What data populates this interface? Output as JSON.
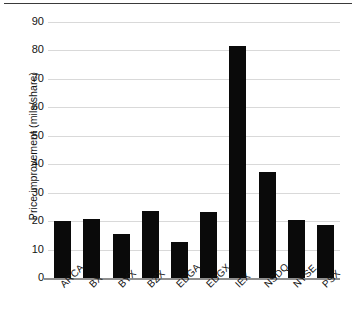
{
  "figure": {
    "top_rule": "",
    "background_color": "#ffffff",
    "bar_color": "#0a0a0a",
    "gridline_color": "#d9d9d9",
    "axis_color": "#8f8f8f"
  },
  "chart_data": {
    "type": "bar",
    "title": "",
    "xlabel": "",
    "ylabel": "Price improvement (mils/share)",
    "categories": [
      "ARCA",
      "BX",
      "BYX",
      "BZX",
      "EDGA",
      "EDGX",
      "IEX",
      "NSDQ",
      "NYSE",
      "PSX"
    ],
    "values": [
      20.0,
      20.8,
      15.5,
      23.5,
      12.7,
      23.2,
      81.5,
      37.2,
      20.5,
      18.5
    ],
    "ylim": [
      0,
      90
    ],
    "yticks": [
      0,
      10,
      20,
      30,
      40,
      50,
      60,
      70,
      80,
      90
    ],
    "ytick_labels": [
      "0",
      "10",
      "20",
      "30",
      "40",
      "50",
      "60",
      "70",
      "80",
      "90"
    ],
    "grid": true,
    "grid_axis": "y",
    "legend": false,
    "legend_position": "none",
    "series": [
      {
        "name": "Price improvement",
        "values": [
          20.0,
          20.8,
          15.5,
          23.5,
          12.7,
          23.2,
          81.5,
          37.2,
          20.5,
          18.5
        ]
      }
    ]
  }
}
